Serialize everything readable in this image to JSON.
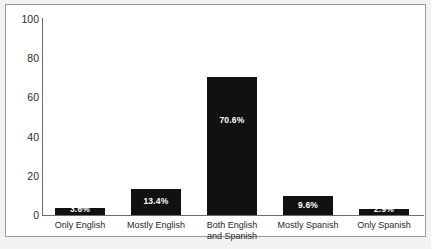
{
  "chart_data": {
    "type": "bar",
    "title": "",
    "subtitle": "",
    "xlabel": "",
    "ylabel": "",
    "ylim": [
      0,
      100
    ],
    "yticks": [
      "0",
      "20",
      "40",
      "60",
      "80",
      "100"
    ],
    "grid": false,
    "legend": "none",
    "categories": [
      "Only English",
      "Mostly English",
      "Both English\nand Spanish",
      "Mostly Spanish",
      "Only Spanish"
    ],
    "values": [
      3.6,
      13.4,
      70.6,
      9.6,
      2.9
    ],
    "value_labels": [
      "3.6%",
      "13.4%",
      "70.6%",
      "9.6%",
      "2.9%"
    ],
    "bar_color": "#111111",
    "value_label_color": "#ffffff",
    "axis_color": "#6d6d6b",
    "background_color": "#ffffff",
    "frame_color": "#9a9a98"
  }
}
